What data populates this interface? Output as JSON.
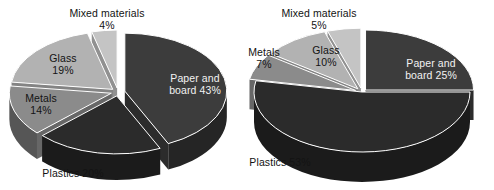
{
  "figure": {
    "background_color": "#ffffff",
    "chart_count": 2
  },
  "palette": {
    "paper_and_board": "#3c3c3c",
    "plastics": "#2b2b2b",
    "metals": "#8b8b8b",
    "glass": "#b2b2b2",
    "mixed_materials": "#c4c4c4",
    "slice_edge": "#ffffff",
    "label_dark": "#131313",
    "label_light": "#f2f2f2"
  },
  "chart_data": [
    {
      "type": "pie",
      "id": "left-pie",
      "title": "",
      "three_d": true,
      "exploded": true,
      "legend": "none",
      "labels": [
        "Paper and board",
        "Plastics",
        "Metals",
        "Glass",
        "Mixed materials"
      ],
      "values": [
        43,
        20,
        14,
        19,
        4
      ],
      "unit": "%",
      "slices": [
        {
          "name": "paper-and-board",
          "label": "Paper and board",
          "value": 43,
          "percent_text": "43%",
          "label_text": "Paper and",
          "label_text2": "board 43%",
          "color": "#3c3c3c",
          "label_placement": "inside",
          "label_color": "light"
        },
        {
          "name": "plastics",
          "label": "Plastics",
          "value": 20,
          "percent_text": "20%",
          "label_text": "Plastics 20%",
          "color": "#2b2b2b",
          "label_placement": "outside-bottom-left",
          "label_color": "dark"
        },
        {
          "name": "metals",
          "label": "Metals",
          "value": 14,
          "percent_text": "14%",
          "label_text": "Metals",
          "label_text2": "14%",
          "color": "#8b8b8b",
          "label_placement": "inside",
          "label_color": "dark"
        },
        {
          "name": "glass",
          "label": "Glass",
          "value": 19,
          "percent_text": "19%",
          "label_text": "Glass",
          "label_text2": "19%",
          "color": "#b2b2b2",
          "label_placement": "inside",
          "label_color": "dark"
        },
        {
          "name": "mixed-materials",
          "label": "Mixed materials",
          "value": 4,
          "percent_text": "4%",
          "label_text": "Mixed materials",
          "label_text2": "4%",
          "color": "#c4c4c4",
          "label_placement": "outside-top",
          "label_color": "dark"
        }
      ]
    },
    {
      "type": "pie",
      "id": "right-pie",
      "title": "",
      "three_d": true,
      "exploded": true,
      "legend": "none",
      "labels": [
        "Paper and board",
        "Plastics",
        "Metals",
        "Glass",
        "Mixed materials"
      ],
      "values": [
        25,
        53,
        7,
        10,
        5
      ],
      "unit": "%",
      "slices": [
        {
          "name": "paper-and-board",
          "label": "Paper and board",
          "value": 25,
          "percent_text": "25%",
          "label_text": "Paper and",
          "label_text2": "board 25%",
          "color": "#3c3c3c",
          "label_placement": "inside",
          "label_color": "light"
        },
        {
          "name": "plastics",
          "label": "Plastics",
          "value": 53,
          "percent_text": "53%",
          "label_text": "Plastics 53%",
          "color": "#2b2b2b",
          "label_placement": "outside-bottom-left",
          "label_color": "dark"
        },
        {
          "name": "metals",
          "label": "Metals",
          "value": 7,
          "percent_text": "7%",
          "label_text": "Metals",
          "label_text2": "7%",
          "color": "#8b8b8b",
          "label_placement": "outside-left",
          "label_color": "dark"
        },
        {
          "name": "glass",
          "label": "Glass",
          "value": 10,
          "percent_text": "10%",
          "label_text": "Glass",
          "label_text2": "10%",
          "color": "#b2b2b2",
          "label_placement": "inside",
          "label_color": "dark"
        },
        {
          "name": "mixed-materials",
          "label": "Mixed materials",
          "value": 5,
          "percent_text": "5%",
          "label_text": "Mixed materials",
          "label_text2": "5%",
          "color": "#c4c4c4",
          "label_placement": "outside-top",
          "label_color": "dark"
        }
      ]
    }
  ]
}
